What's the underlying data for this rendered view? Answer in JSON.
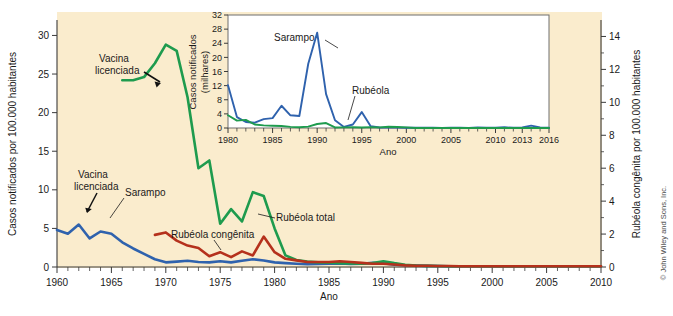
{
  "figure": {
    "background_color": "#faeccd",
    "page_color": "#ffffff",
    "credit": "© John Wiley and Sons, Inc."
  },
  "colors": {
    "sarampo": "#2f62ad",
    "rubeola_total": "#1e9b4e",
    "rubeola_congenita": "#b5311c",
    "axis": "#3b3b3b",
    "text": "#1a1a1a"
  },
  "chart_data": [
    {
      "id": "main",
      "type": "line",
      "title": "",
      "xlabel": "Ano",
      "ylabel": "Casos notificados por 100.000 habitantes",
      "y2label": "Rubéola congênita por 100.000 habitantes",
      "xlim": [
        1960,
        2010
      ],
      "ylim": [
        0,
        32
      ],
      "y2lim": [
        0,
        15
      ],
      "grid": false,
      "legend": "annotations",
      "xticks": [
        1960,
        1965,
        1970,
        1975,
        1980,
        1985,
        1990,
        1995,
        2000,
        2005,
        2010
      ],
      "xticklabels": [
        "1960",
        "1965",
        "1970",
        "1975",
        "1980",
        "1985",
        "1990",
        "1995",
        "2000",
        "2005",
        "2010"
      ],
      "yticks": [
        0,
        5,
        10,
        15,
        20,
        25,
        30
      ],
      "yticklabels": [
        "0",
        "5",
        "10",
        "15",
        "20",
        "25",
        "30"
      ],
      "y2ticks": [
        0,
        2,
        4,
        6,
        8,
        10,
        12,
        14
      ],
      "y2ticklabels": [
        "0",
        "2",
        "4",
        "6",
        "8",
        "10",
        "12",
        "14"
      ],
      "annotations": [
        {
          "name": "vacina-licenciada-sarampo",
          "text_lines": [
            "Vacina",
            "licenciada"
          ],
          "points_to_year": 1963
        },
        {
          "name": "vacina-licenciada-rubeola",
          "text_lines": [
            "Vacina",
            "licenciada"
          ],
          "points_to_year": 1969
        },
        {
          "name": "sarampo-label",
          "text_lines": [
            "Sarampo"
          ],
          "points_to_year": 1966
        },
        {
          "name": "rubeola-total-label",
          "text_lines": [
            "Rubéola total"
          ],
          "points_to_year": 1979
        },
        {
          "name": "rubeola-congenita-label",
          "text_lines": [
            "Rubéola congênita"
          ],
          "points_to_year": 1976
        }
      ],
      "series": [
        {
          "name": "Sarampo",
          "axis": "left",
          "color": "#2f62ad",
          "x": [
            1960,
            1961,
            1962,
            1963,
            1964,
            1965,
            1966,
            1967,
            1968,
            1969,
            1970,
            1971,
            1972,
            1973,
            1974,
            1975,
            1976,
            1977,
            1978,
            1979,
            1980,
            1981,
            1982,
            1983,
            1984,
            1985,
            1986,
            1987,
            1988,
            1989,
            1990,
            1991,
            1992,
            1993,
            1994,
            1995,
            1996,
            1997,
            1998,
            1999,
            2000,
            2001,
            2002,
            2003,
            2004,
            2005,
            2006,
            2007,
            2008,
            2009,
            2010
          ],
          "y": [
            4.8,
            4.3,
            5.5,
            3.7,
            4.6,
            4.3,
            3.2,
            2.4,
            1.7,
            1.0,
            0.6,
            0.7,
            0.8,
            0.65,
            0.6,
            0.75,
            0.6,
            0.8,
            1.0,
            0.85,
            0.6,
            0.5,
            0.42,
            0.35,
            0.38,
            0.42,
            0.45,
            0.4,
            0.42,
            0.55,
            0.48,
            0.3,
            0.22,
            0.18,
            0.15,
            0.12,
            0.1,
            0.1,
            0.1,
            0.1,
            0.1,
            0.1,
            0.1,
            0.1,
            0.1,
            0.1,
            0.1,
            0.1,
            0.1,
            0.1,
            0.1
          ]
        },
        {
          "name": "Rubéola total",
          "axis": "left",
          "color": "#1e9b4e",
          "x": [
            1966,
            1967,
            1968,
            1969,
            1970,
            1971,
            1972,
            1973,
            1974,
            1975,
            1976,
            1977,
            1978,
            1979,
            1980,
            1981,
            1982,
            1983,
            1984,
            1985,
            1986,
            1987,
            1988,
            1989,
            1990,
            1991,
            1992,
            1993,
            1994,
            1995,
            1996,
            1997,
            1998,
            1999,
            2000,
            2001,
            2002,
            2003,
            2004,
            2005,
            2006,
            2007,
            2008,
            2009,
            2010
          ],
          "y": [
            24.2,
            24.2,
            24.6,
            26.4,
            28.8,
            28.0,
            22.0,
            12.8,
            13.8,
            5.6,
            7.5,
            5.9,
            9.7,
            9.2,
            5.0,
            1.5,
            0.9,
            0.7,
            0.6,
            0.55,
            0.5,
            0.45,
            0.42,
            0.5,
            0.75,
            0.5,
            0.3,
            0.2,
            0.15,
            0.12,
            0.1,
            0.1,
            0.1,
            0.1,
            0.1,
            0.1,
            0.1,
            0.1,
            0.1,
            0.1,
            0.1,
            0.1,
            0.1,
            0.1,
            0.1
          ]
        },
        {
          "name": "Rubéola congênita",
          "axis": "right",
          "color": "#b5311c",
          "x": [
            1969,
            1970,
            1971,
            1972,
            1973,
            1974,
            1975,
            1976,
            1977,
            1978,
            1979,
            1980,
            1981,
            1982,
            1983,
            1984,
            1985,
            1986,
            1987,
            1988,
            1989,
            1990,
            1991,
            1992,
            1993,
            1994,
            1995,
            1996,
            1997,
            1998,
            1999,
            2000,
            2001,
            2002,
            2003,
            2004,
            2005,
            2006,
            2007,
            2008,
            2009,
            2010
          ],
          "y": [
            1.95,
            2.1,
            1.6,
            1.3,
            1.15,
            0.65,
            0.9,
            0.6,
            0.95,
            0.7,
            1.85,
            0.9,
            0.5,
            0.4,
            0.3,
            0.3,
            0.3,
            0.35,
            0.3,
            0.25,
            0.2,
            0.2,
            0.15,
            0.1,
            0.08,
            0.08,
            0.06,
            0.06,
            0.05,
            0.05,
            0.05,
            0.05,
            0.05,
            0.05,
            0.05,
            0.05,
            0.05,
            0.05,
            0.05,
            0.05,
            0.05,
            0.05
          ]
        }
      ]
    },
    {
      "id": "inset",
      "type": "line",
      "title": "",
      "xlabel": "Ano",
      "ylabel": "Casos notificados (milhares)",
      "ylabel_lines": [
        "Casos notificados",
        "(milhares)"
      ],
      "xlim": [
        1980,
        2016
      ],
      "ylim": [
        0,
        32
      ],
      "grid": false,
      "legend": "annotations",
      "xticks": [
        1980,
        1985,
        1990,
        1995,
        2000,
        2005,
        2010,
        2013,
        2016
      ],
      "xticklabels": [
        "1980",
        "1985",
        "1990",
        "1995",
        "2000",
        "2005",
        "2010",
        "2013",
        "2016"
      ],
      "yticks": [
        0,
        4,
        8,
        12,
        16,
        20,
        24,
        28,
        32
      ],
      "yticklabels": [
        "0",
        "4",
        "8",
        "12",
        "16",
        "20",
        "24",
        "28",
        "32"
      ],
      "annotations": [
        {
          "name": "sarampo-label-inset",
          "text_lines": [
            "Sarampo"
          ],
          "points_to_year": 1990
        },
        {
          "name": "rubeola-label-inset",
          "text_lines": [
            "Rubéola"
          ],
          "points_to_year": 1991
        }
      ],
      "series": [
        {
          "name": "Sarampo",
          "color": "#2f62ad",
          "x": [
            1980,
            1981,
            1982,
            1983,
            1984,
            1985,
            1986,
            1987,
            1988,
            1989,
            1990,
            1991,
            1992,
            1993,
            1994,
            1995,
            1996,
            1997,
            1998,
            1999,
            2000,
            2001,
            2002,
            2003,
            2004,
            2005,
            2006,
            2007,
            2008,
            2009,
            2010,
            2011,
            2012,
            2013,
            2014,
            2015,
            2016
          ],
          "y": [
            12.1,
            3.1,
            1.7,
            1.5,
            2.5,
            2.8,
            6.3,
            3.6,
            3.4,
            18.2,
            27.0,
            9.6,
            2.2,
            0.3,
            1.0,
            4.5,
            0.5,
            0.14,
            0.1,
            0.1,
            0.09,
            0.12,
            0.05,
            0.06,
            0.04,
            0.07,
            0.06,
            0.04,
            0.14,
            0.07,
            0.06,
            0.22,
            0.06,
            0.19,
            0.67,
            0.19,
            0.07
          ]
        },
        {
          "name": "Rubéola",
          "color": "#1e9b4e",
          "x": [
            1980,
            1981,
            1982,
            1983,
            1984,
            1985,
            1986,
            1987,
            1988,
            1989,
            1990,
            1991,
            1992,
            1993,
            1994,
            1995,
            1996,
            1997,
            1998,
            1999,
            2000,
            2001,
            2002,
            2003,
            2004,
            2005,
            2006,
            2007,
            2008,
            2009,
            2010,
            2011,
            2012,
            2013,
            2014,
            2015,
            2016
          ],
          "y": [
            3.6,
            2.1,
            2.3,
            1.0,
            0.75,
            0.63,
            0.55,
            0.31,
            0.23,
            0.4,
            1.13,
            1.4,
            0.16,
            0.19,
            0.23,
            0.13,
            0.24,
            0.18,
            0.36,
            0.27,
            0.18,
            0.02,
            0.02,
            0.01,
            0.01,
            0.01,
            0.01,
            0.01,
            0.01,
            0.01,
            0.01,
            0.01,
            0.01,
            0.01,
            0.01,
            0.01,
            0.01
          ]
        }
      ]
    }
  ]
}
